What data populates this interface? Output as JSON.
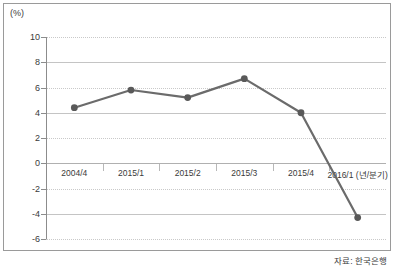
{
  "unit_label": "(%)",
  "source_note": "자료: 한국은행",
  "colors": {
    "line": "#6b6b6b",
    "marker": "#595959",
    "grid": "#c9c9c9",
    "axis": "#8c8c8c",
    "frame": "#9a9a9a",
    "text": "#3a3a3a"
  },
  "chart_data": {
    "type": "line",
    "title": "",
    "xlabel": "년/분기",
    "ylabel": "",
    "unit": "(%)",
    "categories": [
      "2004/4",
      "2015/1",
      "2015/2",
      "2015/3",
      "2015/4",
      "2016/1 (년/분기)"
    ],
    "values": [
      4.4,
      5.8,
      5.2,
      6.7,
      4.0,
      -4.3
    ],
    "series": [
      {
        "name": "",
        "values": [
          4.4,
          5.8,
          5.2,
          6.7,
          4.0,
          -4.3
        ]
      }
    ],
    "ylim": [
      -6,
      10
    ],
    "yticks": [
      10,
      8,
      6,
      4,
      2,
      0,
      -2,
      -4,
      -6
    ],
    "ytick_labels": [
      "10",
      "8",
      "6",
      "4",
      "2",
      "0",
      "-2",
      "-4",
      "-6"
    ],
    "grid": true,
    "legend": false,
    "markers": true,
    "annotations": [
      "자료: 한국은행"
    ]
  }
}
